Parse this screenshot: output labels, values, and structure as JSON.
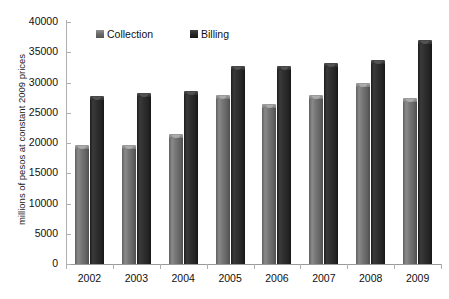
{
  "chart_data": {
    "type": "bar",
    "title": "",
    "xlabel": "",
    "ylabel": "millions of pesos at constant 2009 prices",
    "categories": [
      "2002",
      "2003",
      "2004",
      "2005",
      "2006",
      "2007",
      "2008",
      "2009"
    ],
    "series": [
      {
        "name": "Collection",
        "color": "#6e6e6e",
        "values": [
          19700,
          19600,
          21500,
          28000,
          26500,
          28000,
          30000,
          27400
        ]
      },
      {
        "name": "Billing",
        "color": "#2a2a2a",
        "values": [
          27700,
          28300,
          28600,
          32700,
          32700,
          33300,
          33700,
          37000
        ]
      }
    ],
    "ylim": [
      0,
      40000
    ],
    "ytick_labels": [
      "0",
      "5000",
      "10000",
      "15000",
      "20000",
      "25000",
      "30000",
      "35000",
      "40000"
    ],
    "ytick_values": [
      0,
      5000,
      10000,
      15000,
      20000,
      25000,
      30000,
      35000,
      40000
    ],
    "grid": false,
    "legend_position": "top-inside"
  },
  "legend": {
    "collection_label": "Collection",
    "billing_label": "Billing"
  }
}
